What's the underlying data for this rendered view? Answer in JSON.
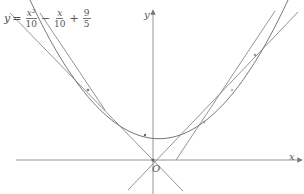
{
  "equation": {
    "lhs": "y",
    "eq": "=",
    "term1": {
      "num": "x²",
      "den": "10"
    },
    "op1": "−",
    "term2": {
      "num": "x",
      "den": "10"
    },
    "op2": "+",
    "term3": {
      "num": "9",
      "den": "5"
    }
  },
  "axes": {
    "x_label": "x",
    "y_label": "y",
    "origin_label": "O"
  },
  "colors": {
    "stroke": "#888888",
    "text": "#555555",
    "background": "#ffffff"
  },
  "geometry": {
    "origin_px": [
      153,
      160
    ],
    "scale_px_per_unit": 12,
    "parabola": {
      "a": 0.1,
      "b": -0.1,
      "c": 1.8
    },
    "tangent_lines_through_origin": [
      {
        "slope": 0.749,
        "touch_x": 4.24
      },
      {
        "slope": -0.949,
        "touch_x": -4.24
      }
    ],
    "steep_lines": [
      {
        "from_px": [
          40,
          12
        ],
        "to_px": [
          100,
          105
        ]
      },
      {
        "from_px": [
          275,
          10
        ],
        "to_px": [
          180,
          160
        ]
      }
    ]
  }
}
